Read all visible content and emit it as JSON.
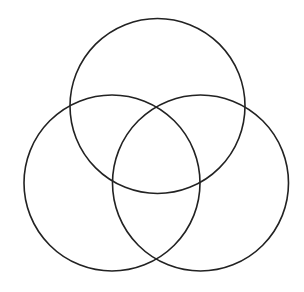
{
  "diagram": {
    "type": "venn",
    "sets": 3,
    "background": "#ffffff",
    "stroke": "#222222",
    "stroke_width": 1.6,
    "circles": [
      {
        "name": "top",
        "cx": 157.5,
        "cy": 106,
        "r": 87.5
      },
      {
        "name": "left",
        "cx": 112,
        "cy": 183,
        "r": 88
      },
      {
        "name": "right",
        "cx": 200.5,
        "cy": 183,
        "r": 88
      }
    ]
  }
}
